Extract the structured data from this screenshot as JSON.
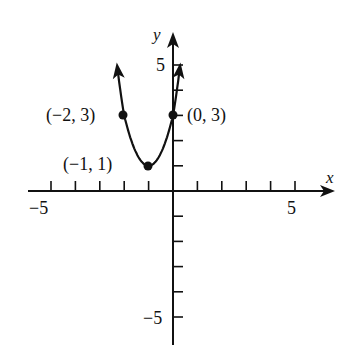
{
  "chart_data": {
    "type": "line",
    "title": "",
    "xlabel": "x",
    "ylabel": "y",
    "xlim": [
      -6,
      6
    ],
    "ylim": [
      -6,
      6
    ],
    "grid": false,
    "x_ticks": [
      -5,
      -4,
      -3,
      -2,
      -1,
      1,
      2,
      3,
      4,
      5
    ],
    "y_ticks": [
      -5,
      -4,
      -3,
      -2,
      -1,
      1,
      2,
      3,
      4,
      5
    ],
    "x_tick_labels": [
      {
        "value": -5,
        "label": "−5"
      },
      {
        "value": 5,
        "label": "5"
      }
    ],
    "y_tick_labels": [
      {
        "value": 5,
        "label": "5"
      },
      {
        "value": -5,
        "label": "−5"
      }
    ],
    "series": [
      {
        "name": "parabola",
        "equation": "y = 2(x + 1)^2 + 1",
        "vertex": [
          -1,
          1
        ],
        "arrows_both_ends": true
      }
    ],
    "points": [
      {
        "x": -2,
        "y": 3,
        "label": "(−2, 3)"
      },
      {
        "x": -1,
        "y": 1,
        "label": "(−1, 1)"
      },
      {
        "x": 0,
        "y": 3,
        "label": "(0, 3)"
      }
    ]
  },
  "colors": {
    "ink": "#111111",
    "background": "#ffffff"
  }
}
